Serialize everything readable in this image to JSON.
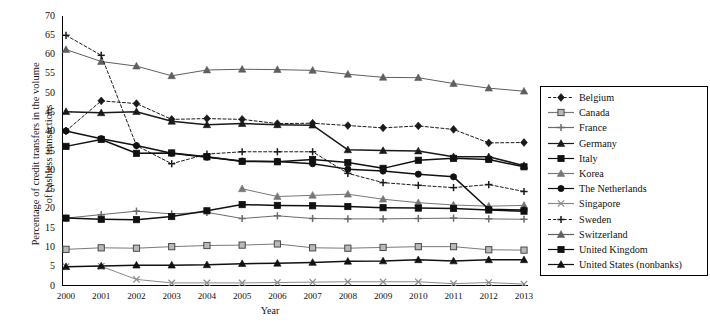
{
  "chart_data": {
    "type": "line",
    "title": "",
    "xlabel": "Year",
    "ylabel": "Percentage of credit transfers in the volume\nof cashless transactions",
    "x": [
      2000,
      2001,
      2002,
      2003,
      2004,
      2005,
      2006,
      2007,
      2008,
      2009,
      2010,
      2011,
      2012,
      2013
    ],
    "xticklabels": [
      "2000",
      "2001",
      "2002",
      "2003",
      "2004",
      "2005",
      "2006",
      "2007",
      "2008",
      "2009",
      "2010",
      "2011",
      "2012",
      "2013"
    ],
    "yticklabels": [
      "0",
      "5",
      "10",
      "15",
      "20",
      "25",
      "30",
      "35",
      "40",
      "45",
      "50",
      "55",
      "60",
      "65",
      "70"
    ],
    "ylim": [
      0,
      70
    ],
    "ytick_step": 5,
    "grid": false,
    "legend_position": "right",
    "series": [
      {
        "name": "Belgium",
        "marker": "diamond",
        "dash": "dashed",
        "color": "#1a1a1a",
        "values": [
          40.2,
          48.0,
          47.3,
          43.2,
          43.4,
          43.2,
          42.1,
          42.2,
          41.6,
          41.0,
          41.5,
          40.6,
          37.1,
          37.2
        ]
      },
      {
        "name": "Canada",
        "marker": "square-open",
        "dash": "solid",
        "color": "#7a7a7a",
        "values": [
          9.5,
          9.9,
          9.8,
          10.2,
          10.5,
          10.6,
          10.9,
          9.9,
          9.8,
          10.0,
          10.2,
          10.2,
          9.4,
          9.3
        ]
      },
      {
        "name": "France",
        "marker": "plus",
        "dash": "solid",
        "color": "#6b6b6b",
        "values": [
          17.6,
          18.5,
          19.4,
          18.7,
          19.1,
          17.5,
          18.2,
          17.5,
          17.4,
          17.4,
          17.5,
          17.6,
          17.4,
          17.3
        ]
      },
      {
        "name": "Germany",
        "marker": "triangle",
        "dash": "solid",
        "color": "#1a1a1a",
        "values": [
          45.2,
          44.9,
          45.2,
          42.7,
          41.8,
          42.1,
          41.8,
          41.7,
          35.3,
          35.1,
          35.0,
          33.5,
          33.5,
          31.2
        ]
      },
      {
        "name": "Italy",
        "marker": "square",
        "dash": "solid",
        "color": "#111111",
        "values": [
          17.6,
          17.3,
          17.2,
          18.0,
          19.5,
          21.1,
          20.9,
          20.8,
          20.6,
          20.3,
          20.2,
          20.1,
          19.7,
          19.4
        ]
      },
      {
        "name": "Korea",
        "marker": "triangle",
        "dash": "solid",
        "color": "#777777",
        "values": [
          null,
          null,
          null,
          null,
          null,
          25.2,
          23.2,
          23.5,
          23.8,
          22.5,
          21.6,
          21.0,
          20.7,
          20.9
        ]
      },
      {
        "name": "The Netherlands",
        "marker": "circle",
        "dash": "solid",
        "color": "#111111",
        "values": [
          40.2,
          38.2,
          36.4,
          34.4,
          33.4,
          32.4,
          32.3,
          31.7,
          30.3,
          29.8,
          29.0,
          28.3,
          19.9,
          19.7
        ]
      },
      {
        "name": "Singapore",
        "marker": "x",
        "dash": "solid",
        "color": "#8a8a8a",
        "values": [
          5.0,
          5.1,
          1.7,
          0.8,
          0.8,
          0.8,
          0.9,
          1.0,
          1.1,
          1.1,
          1.1,
          0.6,
          0.9,
          0.5
        ]
      },
      {
        "name": "Sweden",
        "marker": "plus",
        "dash": "dashed",
        "color": "#1a1a1a",
        "values": [
          65.0,
          59.8,
          36.4,
          31.7,
          34.2,
          34.8,
          34.8,
          34.8,
          29.2,
          26.8,
          26.1,
          25.5,
          26.3,
          24.5
        ]
      },
      {
        "name": "Switzerland",
        "marker": "triangle",
        "dash": "solid",
        "color": "#5f5f5f",
        "values": [
          61.3,
          58.2,
          57.0,
          54.5,
          56.0,
          56.2,
          56.1,
          55.9,
          54.9,
          54.1,
          54.0,
          52.5,
          51.3,
          50.5
        ]
      },
      {
        "name": "United Kingdom",
        "marker": "square",
        "dash": "solid",
        "color": "#111111",
        "values": [
          36.2,
          38.0,
          34.4,
          34.5,
          33.5,
          32.3,
          32.2,
          32.8,
          32.0,
          30.5,
          32.6,
          33.1,
          32.8,
          30.9
        ]
      },
      {
        "name": "United States (nonbanks)",
        "marker": "triangle",
        "dash": "solid",
        "color": "#111111",
        "values": [
          5.0,
          5.2,
          5.4,
          5.4,
          5.5,
          5.8,
          5.9,
          6.1,
          6.4,
          6.5,
          6.8,
          6.5,
          6.8,
          6.8
        ]
      }
    ]
  }
}
